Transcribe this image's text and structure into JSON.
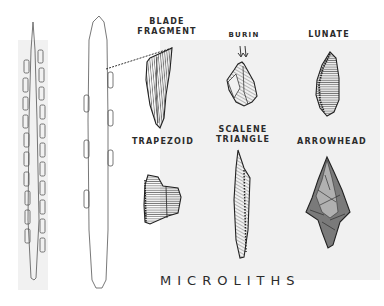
{
  "diagram": {
    "title": "MICROLITHS",
    "labels": {
      "blade_fragment_line1": "BLADE",
      "blade_fragment_line2": "FRAGMENT",
      "burin": "BURIN",
      "lunate": "LUNATE",
      "trapezoid": "TRAPEZOID",
      "scalene_line1": "SCALENE",
      "scalene_line2": "TRIANGLE",
      "arrowhead": "ARROWHEAD"
    },
    "items": [
      {
        "name": "composite-tool-slender",
        "description": "slender hafted shaft with inset microliths on both edges"
      },
      {
        "name": "composite-tool-wide",
        "description": "wider hafted shaft with inset microliths"
      },
      {
        "name": "blade-fragment"
      },
      {
        "name": "burin"
      },
      {
        "name": "lunate"
      },
      {
        "name": "trapezoid"
      },
      {
        "name": "scalene-triangle"
      },
      {
        "name": "arrowhead"
      }
    ],
    "colors": {
      "ink": "#2b2b2b",
      "panel": "#f1f1f1",
      "background": "#ffffff"
    }
  }
}
